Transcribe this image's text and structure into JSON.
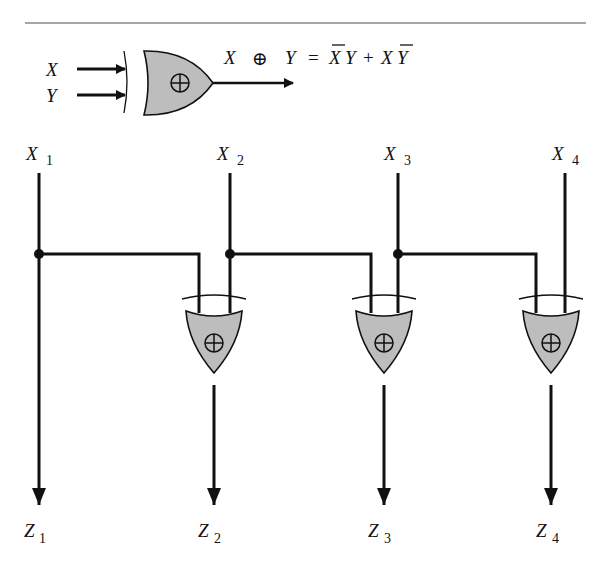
{
  "legend": {
    "input_x": "X",
    "input_y": "Y",
    "equation": {
      "lhs_x": "X",
      "op": "⊕",
      "lhs_y": "Y",
      "equals": "=",
      "term1_a": "X",
      "term1_b": "Y",
      "plus": "+",
      "term2_a": "X",
      "term2_b": "Y"
    },
    "gate_symbol": "⊕"
  },
  "inputs": [
    {
      "name": "X",
      "sub": "1"
    },
    {
      "name": "X",
      "sub": "2"
    },
    {
      "name": "X",
      "sub": "3"
    },
    {
      "name": "X",
      "sub": "4"
    }
  ],
  "outputs": [
    {
      "name": "Z",
      "sub": "1"
    },
    {
      "name": "Z",
      "sub": "2"
    },
    {
      "name": "Z",
      "sub": "3"
    },
    {
      "name": "Z",
      "sub": "4"
    }
  ],
  "colors": {
    "gate_fill": "#bdbdbd",
    "line": "#111111",
    "rule": "#888888"
  }
}
